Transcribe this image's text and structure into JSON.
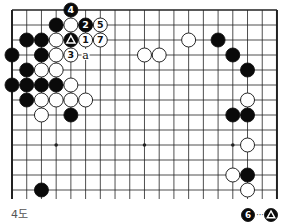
{
  "diagram": {
    "caption": "4도",
    "board": {
      "columns": 19,
      "rows_visible": 13,
      "origin_x": 12,
      "origin_y": 10,
      "spacing_x": 14.72,
      "spacing_y": 15,
      "cut_bottom_extension": 9,
      "edges": {
        "left": true,
        "top": true,
        "right": true,
        "bottom": false
      },
      "hoshi": [
        [
          3,
          9
        ],
        [
          9,
          9
        ],
        [
          15,
          9
        ]
      ],
      "colors": {
        "line": "#222222",
        "black_stone": "#0a0a0a",
        "white_stone": "#ffffff",
        "label_on_white": "#111111",
        "label_on_black": "#ffffff"
      }
    },
    "stones": [
      {
        "c": 4,
        "r": 0,
        "color": "black",
        "label": "4"
      },
      {
        "c": 3,
        "r": 1,
        "color": "black",
        "label": ""
      },
      {
        "c": 4,
        "r": 1,
        "color": "white",
        "label": ""
      },
      {
        "c": 5,
        "r": 1,
        "color": "black",
        "label": "2"
      },
      {
        "c": 6,
        "r": 1,
        "color": "white",
        "label": "5"
      },
      {
        "c": 1,
        "r": 2,
        "color": "black",
        "label": ""
      },
      {
        "c": 2,
        "r": 2,
        "color": "black",
        "label": ""
      },
      {
        "c": 3,
        "r": 2,
        "color": "white",
        "label": ""
      },
      {
        "c": 4,
        "r": 2,
        "color": "black",
        "label": "triangle"
      },
      {
        "c": 5,
        "r": 2,
        "color": "white",
        "label": "1"
      },
      {
        "c": 6,
        "r": 2,
        "color": "white",
        "label": "7"
      },
      {
        "c": 12,
        "r": 2,
        "color": "white",
        "label": ""
      },
      {
        "c": 14,
        "r": 2,
        "color": "black",
        "label": ""
      },
      {
        "c": 0,
        "r": 3,
        "color": "black",
        "label": ""
      },
      {
        "c": 2,
        "r": 3,
        "color": "black",
        "label": ""
      },
      {
        "c": 3,
        "r": 3,
        "color": "white",
        "label": ""
      },
      {
        "c": 4,
        "r": 3,
        "color": "white",
        "label": "3"
      },
      {
        "c": 9,
        "r": 3,
        "color": "white",
        "label": ""
      },
      {
        "c": 10,
        "r": 3,
        "color": "white",
        "label": ""
      },
      {
        "c": 15,
        "r": 3,
        "color": "black",
        "label": ""
      },
      {
        "c": 1,
        "r": 4,
        "color": "black",
        "label": ""
      },
      {
        "c": 2,
        "r": 4,
        "color": "white",
        "label": ""
      },
      {
        "c": 3,
        "r": 4,
        "color": "white",
        "label": ""
      },
      {
        "c": 16,
        "r": 4,
        "color": "black",
        "label": ""
      },
      {
        "c": 0,
        "r": 5,
        "color": "black",
        "label": ""
      },
      {
        "c": 1,
        "r": 5,
        "color": "black",
        "label": ""
      },
      {
        "c": 2,
        "r": 5,
        "color": "black",
        "label": ""
      },
      {
        "c": 3,
        "r": 5,
        "color": "black",
        "label": ""
      },
      {
        "c": 4,
        "r": 5,
        "color": "white",
        "label": ""
      },
      {
        "c": 1,
        "r": 6,
        "color": "black",
        "label": ""
      },
      {
        "c": 2,
        "r": 6,
        "color": "white",
        "label": ""
      },
      {
        "c": 3,
        "r": 6,
        "color": "white",
        "label": ""
      },
      {
        "c": 4,
        "r": 6,
        "color": "white",
        "label": ""
      },
      {
        "c": 5,
        "r": 6,
        "color": "white",
        "label": ""
      },
      {
        "c": 16,
        "r": 6,
        "color": "white",
        "label": ""
      },
      {
        "c": 2,
        "r": 7,
        "color": "white",
        "label": ""
      },
      {
        "c": 4,
        "r": 7,
        "color": "black",
        "label": ""
      },
      {
        "c": 15,
        "r": 7,
        "color": "black",
        "label": ""
      },
      {
        "c": 16,
        "r": 7,
        "color": "black",
        "label": ""
      },
      {
        "c": 16,
        "r": 9,
        "color": "white",
        "label": ""
      },
      {
        "c": 15,
        "r": 11,
        "color": "white",
        "label": ""
      },
      {
        "c": 16,
        "r": 11,
        "color": "black",
        "label": ""
      },
      {
        "c": 2,
        "r": 12,
        "color": "black",
        "label": ""
      },
      {
        "c": 16,
        "r": 12,
        "color": "white",
        "label": ""
      }
    ],
    "markers": [
      {
        "c": 5,
        "r": 3,
        "text": "a"
      }
    ],
    "note": {
      "from": {
        "color": "black",
        "label": "6"
      },
      "separator": "···",
      "to": {
        "color": "black",
        "label": "triangle"
      }
    }
  }
}
